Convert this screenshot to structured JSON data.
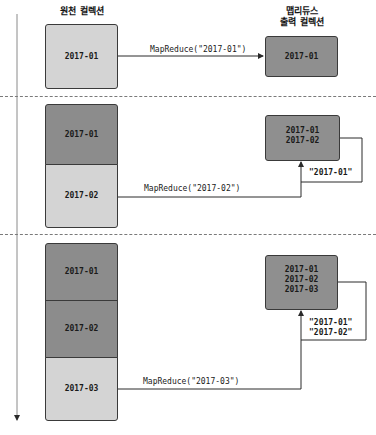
{
  "headers": {
    "source_collection": "원천 컬렉션",
    "output_collection_line1": "맵리듀스",
    "output_collection_line2": "출력 컬렉션"
  },
  "colors": {
    "light_box": "#d4d4d4",
    "dark_box": "#8c8c8c",
    "output_box": "#8f8f8f",
    "line": "#2a2a2a",
    "divider": "#7a7a7a"
  },
  "stages": [
    {
      "source_blocks": [
        {
          "label": "2017-01",
          "shade": "light"
        }
      ],
      "call_label": "MapReduce(\"2017-01\")",
      "output_lines": [
        "2017-01"
      ],
      "feedback_labels": []
    },
    {
      "source_blocks": [
        {
          "label": "2017-01",
          "shade": "dark"
        },
        {
          "label": "2017-02",
          "shade": "light"
        }
      ],
      "call_label": "MapReduce(\"2017-02\")",
      "output_lines": [
        "2017-01",
        "2017-02"
      ],
      "feedback_labels": [
        "\"2017-01\""
      ]
    },
    {
      "source_blocks": [
        {
          "label": "2017-01",
          "shade": "dark"
        },
        {
          "label": "2017-02",
          "shade": "dark"
        },
        {
          "label": "2017-03",
          "shade": "light"
        }
      ],
      "call_label": "MapReduce(\"2017-03\")",
      "output_lines": [
        "2017-01",
        "2017-02",
        "2017-03"
      ],
      "feedback_labels": [
        "\"2017-01\"",
        "\"2017-02\""
      ]
    }
  ]
}
